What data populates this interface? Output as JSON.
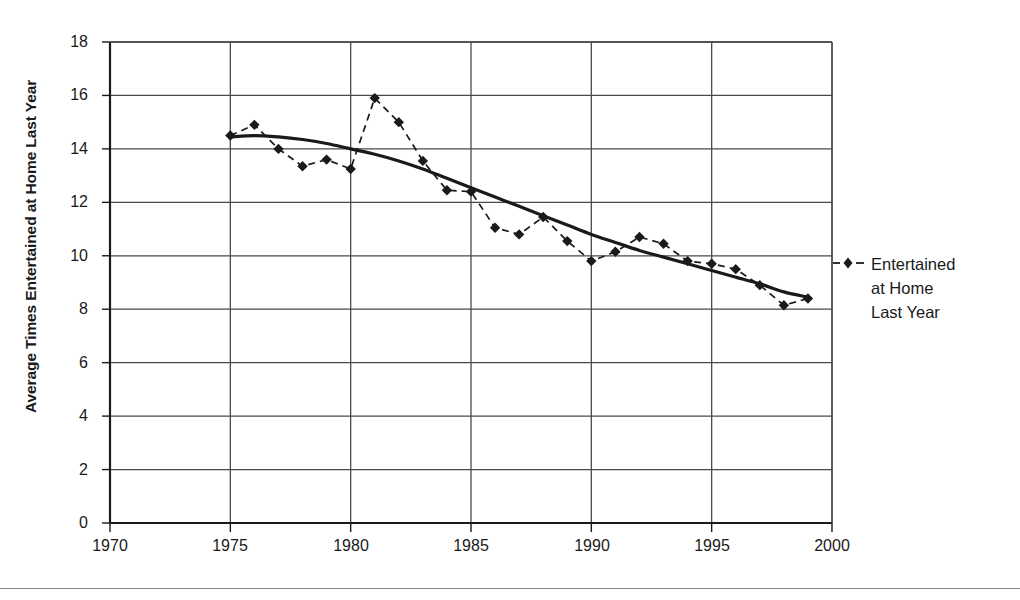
{
  "chart_data": {
    "type": "line",
    "title": "",
    "subtitle": "",
    "xlabel": "",
    "ylabel": "Average Times Entertained at Home Last Year",
    "xlim": [
      1970,
      2000
    ],
    "ylim": [
      0,
      18
    ],
    "x_ticks": [
      1970,
      1975,
      1980,
      1985,
      1990,
      1995,
      2000
    ],
    "y_ticks": [
      0,
      2,
      4,
      6,
      8,
      10,
      12,
      14,
      16,
      18
    ],
    "grid": "both",
    "legend_position": "right",
    "x": [
      1975,
      1976,
      1977,
      1978,
      1979,
      1980,
      1981,
      1982,
      1983,
      1984,
      1985,
      1986,
      1987,
      1988,
      1989,
      1990,
      1991,
      1992,
      1993,
      1994,
      1995,
      1996,
      1997,
      1998,
      1999
    ],
    "series": [
      {
        "name": "Entertained at Home Last Year",
        "style": "dashed-with-diamond-markers",
        "color": "#1a1a1a",
        "values": [
          14.5,
          14.9,
          14.0,
          13.35,
          13.6,
          13.25,
          15.9,
          15.0,
          13.55,
          12.45,
          12.4,
          11.05,
          10.8,
          11.45,
          10.55,
          9.8,
          10.15,
          10.7,
          10.45,
          9.8,
          9.7,
          9.5,
          8.9,
          8.15,
          8.4
        ]
      },
      {
        "name": "trend",
        "style": "solid-smooth-curve",
        "color": "#1a1a1a",
        "values": [
          14.45,
          14.5,
          14.45,
          14.35,
          14.2,
          14.0,
          13.8,
          13.55,
          13.25,
          12.9,
          12.55,
          12.2,
          11.85,
          11.5,
          11.15,
          10.8,
          10.5,
          10.2,
          9.95,
          9.7,
          9.45,
          9.2,
          8.95,
          8.65,
          8.45
        ]
      }
    ],
    "annotations": []
  },
  "axis": {
    "y_title": "Average Times Entertained at Home Last Year",
    "y_tick_labels": [
      "18",
      "16",
      "14",
      "12",
      "10",
      "8",
      "6",
      "4",
      "2",
      "0"
    ],
    "x_tick_labels": [
      "1970",
      "1975",
      "1980",
      "1985",
      "1990",
      "1995",
      "2000"
    ]
  },
  "legend": {
    "entries": [
      {
        "label": "Entertained\nat Home\nLast Year",
        "marker": "diamond-marker",
        "line": "dashed"
      }
    ]
  },
  "colors": {
    "ink": "#1a1a1a",
    "grid": "#4a4a4a",
    "rule": "#8a8a8a",
    "background": "#ffffff"
  }
}
